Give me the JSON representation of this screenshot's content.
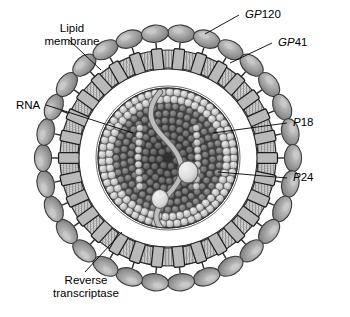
{
  "figure": {
    "background_color": "#ffffff",
    "ink_color": "#000000"
  },
  "labels": {
    "lipid_membrane": {
      "line1": "Lipid",
      "line2": "membrane"
    },
    "rna": "RNA",
    "reverse_transcriptase": {
      "line1": "Reverse",
      "line2": "transcriptase"
    },
    "gp120": {
      "prefix": "GP",
      "number": "120"
    },
    "gp41": {
      "prefix": "GP",
      "number": "41"
    },
    "p18": {
      "prefix": "P",
      "number": "18"
    },
    "p24": {
      "prefix": "P",
      "number": "24"
    }
  },
  "colors": {
    "spike_head_fill": "#9a9a9a",
    "spike_head_highlight": "#c8c8c8",
    "spike_head_stroke": "#3a3a3a",
    "membrane_band": "#d8d8d8",
    "membrane_hatch": "#8f8f8f",
    "membrane_stroke": "#2e2e2e",
    "gp41_block": "#b9b9b9",
    "gp41_stroke": "#1f1f1f",
    "matrix_fill": "#ffffff",
    "capsid_shell_sphere": "#d0d0d0",
    "capsid_inner_dark": "#4a4a4a",
    "capsid_core_darkest": "#343434",
    "rna_strand": "#b5b5b5",
    "rna_stroke": "#4d4d4d",
    "enzyme_fill": "#e2e2e2",
    "enzyme_stroke": "#5a5a5a",
    "leader_line": "#000000"
  },
  "geometry": {
    "center_x": 168,
    "center_y": 158,
    "spike_ring_radius": 124,
    "membrane_outer_radius": 108,
    "membrane_inner_radius": 90,
    "matrix_inner_radius": 72,
    "capsid_radius": 70,
    "spike_count": 30,
    "gp41_count": 30
  },
  "structures": [
    {
      "name": "gp120-spike-head",
      "description": "outer envelope glycoprotein knob"
    },
    {
      "name": "gp41-transmembrane-block",
      "description": "membrane anchored glycoprotein"
    },
    {
      "name": "lipid-bilayer-ring",
      "description": "hatched lipid membrane band"
    },
    {
      "name": "p18-matrix-layer",
      "description": "matrix protein layer inside membrane"
    },
    {
      "name": "p24-capsid",
      "description": "capsid sphere of packed protein subunits"
    },
    {
      "name": "rna-strand",
      "description": "single stranded viral genome"
    },
    {
      "name": "reverse-transcriptase-enzyme",
      "description": "enzyme bead on RNA"
    }
  ]
}
